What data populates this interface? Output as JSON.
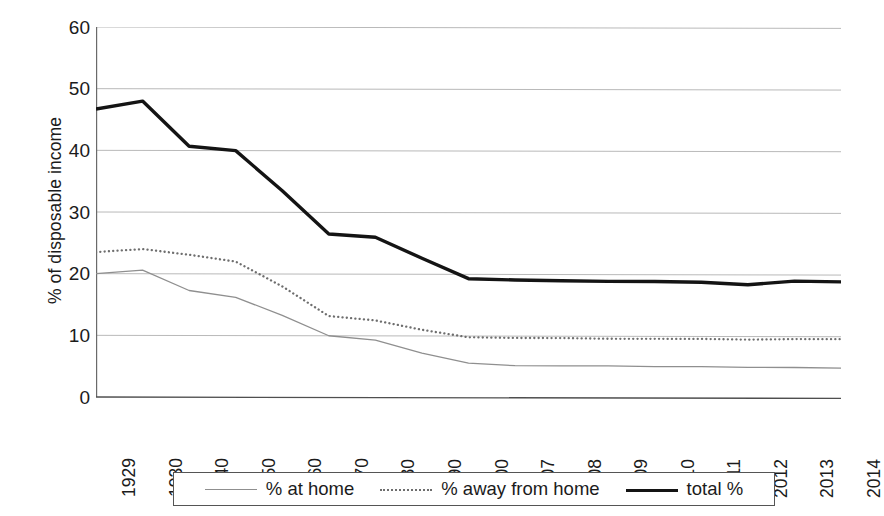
{
  "chart_data": {
    "type": "line",
    "title": "",
    "subtitle": "",
    "xlabel": "",
    "ylabel": "% of disposable income",
    "categories": [
      "1929",
      "1930",
      "1940",
      "1950",
      "1960",
      "1970",
      "1980",
      "1990",
      "2000",
      "2007",
      "2008",
      "2009",
      "2010",
      "2011",
      "2012",
      "2013",
      "2014"
    ],
    "yticks": [
      60,
      50,
      40,
      30,
      20,
      10,
      0
    ],
    "ylim": [
      0,
      60
    ],
    "grid": "horizontal",
    "legend_position": "bottom",
    "series": [
      {
        "name": "% at home",
        "style": "thin-solid-gray",
        "color": "#8f8f8f",
        "values": [
          20.0,
          20.6,
          17.3,
          16.2,
          13.3,
          10.0,
          9.3,
          7.2,
          5.6,
          5.2,
          5.2,
          5.2,
          5.1,
          5.1,
          5.0,
          5.0,
          4.9
        ]
      },
      {
        "name": "% away from home",
        "style": "dotted-gray",
        "color": "#6e6e6e",
        "values": [
          23.5,
          24.0,
          23.1,
          22.0,
          18.0,
          13.2,
          12.5,
          11.0,
          9.8,
          9.7,
          9.7,
          9.6,
          9.6,
          9.6,
          9.5,
          9.6,
          9.6
        ]
      },
      {
        "name": "total %",
        "style": "thick-solid-black",
        "color": "#141414",
        "values": [
          46.7,
          48.0,
          40.7,
          40.0,
          33.5,
          26.5,
          26.0,
          22.6,
          19.3,
          19.1,
          19.0,
          18.9,
          18.9,
          18.8,
          18.4,
          19.0,
          18.9
        ]
      }
    ],
    "annotations": []
  },
  "axis": {
    "y_title": "% of disposable income",
    "y_tick_labels": [
      "60",
      "50",
      "40",
      "30",
      "20",
      "10",
      "0"
    ],
    "x_tick_labels": [
      "1929",
      "1930",
      "1940",
      "1950",
      "1960",
      "1970",
      "1980",
      "1990",
      "2000",
      "2007",
      "2008",
      "2009",
      "2010",
      "2011",
      "2012",
      "2013",
      "2014"
    ]
  },
  "legend": {
    "items": [
      {
        "label": "% at home",
        "swatch": "thin-line-swatch"
      },
      {
        "label": "% away from home",
        "swatch": "dotted-line-swatch"
      },
      {
        "label": "total %",
        "swatch": "thick-line-swatch"
      }
    ]
  },
  "colors": {
    "at_home": "#8f8f8f",
    "away_from_home": "#6e6e6e",
    "total": "#141414",
    "grid": "#b9b9b9",
    "axis": "#6a6a6a",
    "text": "#1b1b1b"
  }
}
